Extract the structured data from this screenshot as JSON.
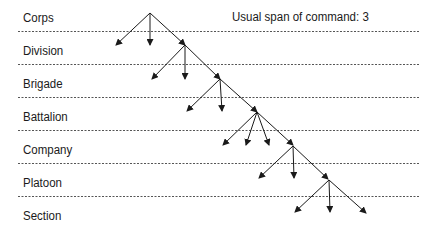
{
  "diagram": {
    "title_note": "Usual span of command: 3",
    "levels": [
      {
        "label": "Corps",
        "top": 11
      },
      {
        "label": "Division",
        "top": 44
      },
      {
        "label": "Brigade",
        "top": 77
      },
      {
        "label": "Battalion",
        "top": 110
      },
      {
        "label": "Company",
        "top": 143
      },
      {
        "label": "Platoon",
        "top": 176
      },
      {
        "label": "Section",
        "top": 209
      }
    ],
    "separators_y": [
      31,
      64,
      97,
      130,
      163,
      196
    ],
    "line_color": "#555555",
    "arrow_color": "#1a1a1a",
    "fans": [
      {
        "from": [
          150,
          13
        ],
        "to": [
          [
            116,
            45
          ],
          [
            150,
            45
          ],
          [
            185,
            45
          ]
        ]
      },
      {
        "from": [
          185,
          45
        ],
        "to": [
          [
            152,
            79
          ],
          [
            185,
            79
          ],
          [
            220,
            79
          ]
        ]
      },
      {
        "from": [
          220,
          79
        ],
        "to": [
          [
            187,
            111
          ],
          [
            222,
            111
          ],
          [
            257,
            112
          ]
        ]
      },
      {
        "from": [
          257,
          112
        ],
        "to": [
          [
            223,
            145
          ],
          [
            246,
            145
          ],
          [
            269,
            145
          ],
          [
            293,
            145
          ]
        ]
      },
      {
        "from": [
          293,
          146
        ],
        "to": [
          [
            259,
            178
          ],
          [
            294,
            178
          ],
          [
            328,
            179
          ]
        ]
      },
      {
        "from": [
          329,
          180
        ],
        "to": [
          [
            295,
            212
          ],
          [
            330,
            212
          ],
          [
            366,
            213
          ]
        ]
      }
    ]
  }
}
